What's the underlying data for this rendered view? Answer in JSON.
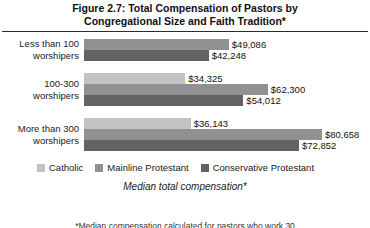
{
  "figure": {
    "title_line1": "Figure 2.7: Total Compensation of Pastors by",
    "title_line2": "Congregational Size and Faith Tradition*",
    "axis_title": "Median total compensation*",
    "footnote": "*Median compensation calculated for pastors who work 30"
  },
  "legend": {
    "items": [
      {
        "label": "Catholic",
        "color": "#c3c3c3"
      },
      {
        "label": "Mainline Protestant",
        "color": "#919191"
      },
      {
        "label": "Conservative Protestant",
        "color": "#636363"
      }
    ]
  },
  "chart_data": {
    "type": "bar",
    "orientation": "horizontal",
    "title": "Figure 2.7: Total Compensation of Pastors by Congregational Size and Faith Tradition*",
    "xlabel": "Median total compensation*",
    "ylabel": "",
    "grid": false,
    "legend_position": "bottom-left",
    "xlim": [
      0,
      80658
    ],
    "categories": [
      "Less than 100 worshipers",
      "100-300 worshipers",
      "More than 300 worshipers"
    ],
    "series": [
      {
        "name": "Catholic",
        "color": "#c3c3c3",
        "values": [
          null,
          34325,
          36143
        ],
        "labels": [
          "",
          "$34,325",
          "$36,143"
        ]
      },
      {
        "name": "Mainline Protestant",
        "color": "#919191",
        "values": [
          49086,
          62300,
          80658
        ],
        "labels": [
          "$49,086",
          "$62,300",
          "$80,658"
        ]
      },
      {
        "name": "Conservative Protestant",
        "color": "#636363",
        "values": [
          42248,
          54012,
          72852
        ],
        "labels": [
          "$42,248",
          "$54,012",
          "$72,852"
        ]
      }
    ]
  },
  "groups": [
    {
      "label_line1": "Less than 100",
      "label_line2": "worshipers",
      "bars": [
        {
          "series": "Mainline Protestant",
          "value": 49086,
          "label": "$49,086",
          "color": "#919191"
        },
        {
          "series": "Conservative Protestant",
          "value": 42248,
          "label": "$42,248",
          "color": "#636363"
        }
      ]
    },
    {
      "label_line1": "100-300",
      "label_line2": "worshipers",
      "bars": [
        {
          "series": "Catholic",
          "value": 34325,
          "label": "$34,325",
          "color": "#c3c3c3"
        },
        {
          "series": "Mainline Protestant",
          "value": 62300,
          "label": "$62,300",
          "color": "#919191"
        },
        {
          "series": "Conservative Protestant",
          "value": 54012,
          "label": "$54,012",
          "color": "#636363"
        }
      ]
    },
    {
      "label_line1": "More than 300",
      "label_line2": "worshipers",
      "bars": [
        {
          "series": "Catholic",
          "value": 36143,
          "label": "$36,143",
          "color": "#c3c3c3"
        },
        {
          "series": "Mainline Protestant",
          "value": 80658,
          "label": "$80,658",
          "color": "#919191"
        },
        {
          "series": "Conservative Protestant",
          "value": 72852,
          "label": "$72,852",
          "color": "#636363"
        }
      ]
    }
  ],
  "scale": {
    "max_value": 80658,
    "max_width_px": 238
  }
}
